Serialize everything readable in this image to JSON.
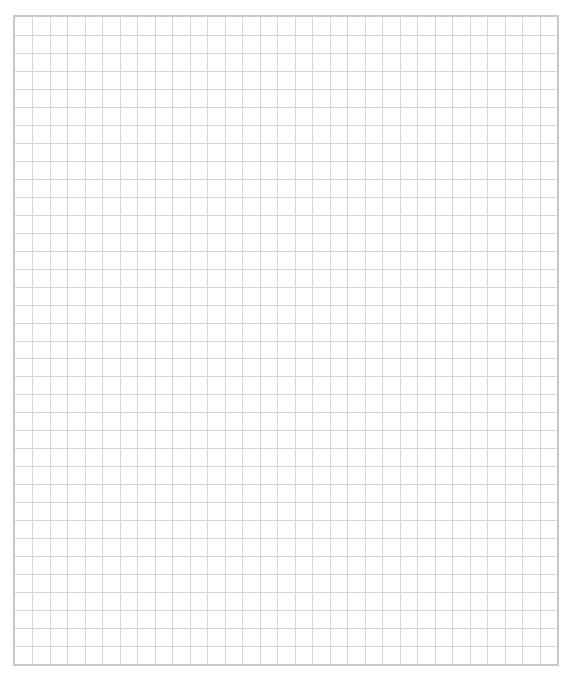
{
  "sheet": {
    "type": "graph-paper",
    "columns": 31,
    "rows": 36,
    "colors": {
      "background": "#ffffff",
      "grid_line": "#d6d6d6",
      "border": "#c9c9c9"
    }
  }
}
